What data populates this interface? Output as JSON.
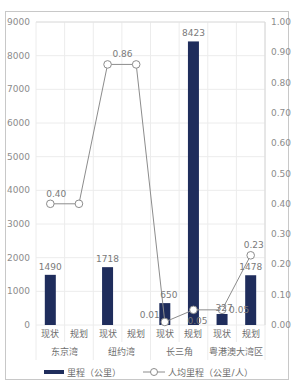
{
  "chart_data": {
    "type": "bar+line",
    "title": "",
    "groups": [
      "东京湾",
      "纽约湾",
      "长三角",
      "粤港澳大湾区"
    ],
    "categories": [
      "现状",
      "规划",
      "现状",
      "规划",
      "现状",
      "规划",
      "现状",
      "规划"
    ],
    "series": [
      {
        "name": "里程（公里）",
        "type": "bar",
        "axis": "left",
        "color": "#1f2d5c",
        "values": [
          1490,
          null,
          1718,
          null,
          650,
          8423,
          327,
          1478
        ],
        "labels": [
          "1490",
          "",
          "1718",
          "",
          "650",
          "8423",
          "327",
          "1478"
        ]
      },
      {
        "name": "人均里程（公里/人）",
        "type": "line",
        "axis": "right",
        "color": "#8c8c8c",
        "values": [
          0.4,
          0.4,
          0.86,
          0.86,
          0.01,
          0.05,
          0.05,
          0.23
        ],
        "labels": [
          "0.40",
          "",
          "0.86",
          "",
          "0.01",
          "0.05",
          "0.05",
          "0.23"
        ]
      }
    ],
    "y_left": {
      "ticks": [
        "0",
        "1000",
        "2000",
        "3000",
        "4000",
        "5000",
        "6000",
        "7000",
        "8000",
        "9000"
      ],
      "ylim": [
        0,
        9000
      ]
    },
    "y_right": {
      "ticks": [
        "0.00",
        "0.10",
        "0.20",
        "0.30",
        "0.40",
        "0.50",
        "0.60",
        "0.70",
        "0.80",
        "0.90",
        "1.00"
      ],
      "ylim": [
        0,
        1.0
      ]
    },
    "grid": true,
    "legend_position": "bottom"
  },
  "legend": {
    "bar_label": "里程（公里）",
    "line_label": "人均里程（公里/人）"
  }
}
